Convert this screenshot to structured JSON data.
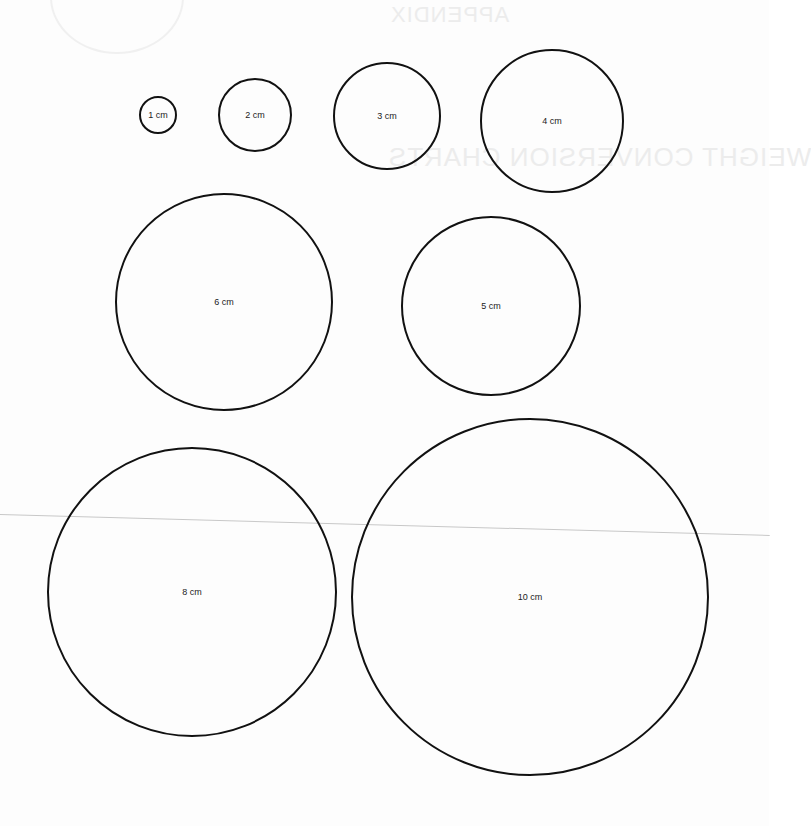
{
  "page": {
    "background_color": "#fdfdfd",
    "stroke_color": "#111111",
    "bleed_through": {
      "appendix_label": "APPENDIX",
      "section_title": "WEIGHT CONVERSION CHARTS"
    }
  },
  "circles": [
    {
      "id": "1cm",
      "label": "1 cm",
      "cx": 158,
      "cy": 115,
      "r": 19
    },
    {
      "id": "2cm",
      "label": "2 cm",
      "cx": 255,
      "cy": 115,
      "r": 37
    },
    {
      "id": "3cm",
      "label": "3 cm",
      "cx": 387,
      "cy": 116,
      "r": 54
    },
    {
      "id": "4cm",
      "label": "4 cm",
      "cx": 552,
      "cy": 121,
      "r": 72
    },
    {
      "id": "6cm",
      "label": "6 cm",
      "cx": 224,
      "cy": 302,
      "r": 109
    },
    {
      "id": "5cm",
      "label": "5 cm",
      "cx": 491,
      "cy": 306,
      "r": 90
    },
    {
      "id": "8cm",
      "label": "8 cm",
      "cx": 192,
      "cy": 592,
      "r": 145
    },
    {
      "id": "10cm",
      "label": "10 cm",
      "cx": 530,
      "cy": 597,
      "r": 179
    }
  ]
}
